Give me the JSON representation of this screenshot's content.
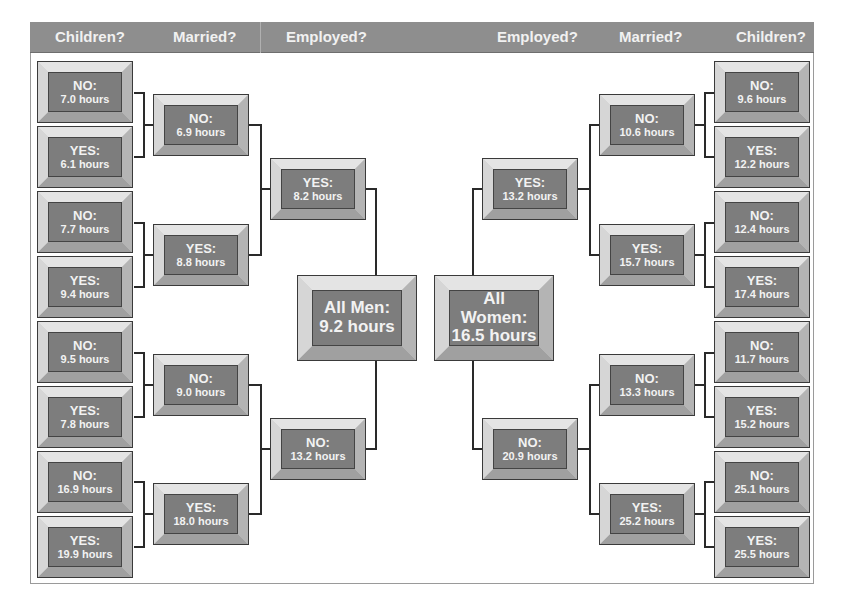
{
  "header": {
    "left": [
      "Children?",
      "Married?",
      "Employed?"
    ],
    "right": [
      "Employed?",
      "Married?",
      "Children?"
    ]
  },
  "men": {
    "root": {
      "label": "All Men:",
      "value": "9.2 hours"
    },
    "employed": [
      {
        "label": "YES:",
        "value": "8.2 hours"
      },
      {
        "label": "NO:",
        "value": "13.2 hours"
      }
    ],
    "married": [
      {
        "label": "NO:",
        "value": "6.9 hours"
      },
      {
        "label": "YES:",
        "value": "8.8  hours"
      },
      {
        "label": "NO:",
        "value": "9.0 hours"
      },
      {
        "label": "YES:",
        "value": "18.0 hours"
      }
    ],
    "children": [
      {
        "label": "NO:",
        "value": "7.0  hours"
      },
      {
        "label": "YES:",
        "value": "6.1  hours"
      },
      {
        "label": "NO:",
        "value": "7.7 hours"
      },
      {
        "label": "YES:",
        "value": "9.4 hours"
      },
      {
        "label": "NO:",
        "value": "9.5 hours"
      },
      {
        "label": "YES:",
        "value": "7.8 hours"
      },
      {
        "label": "NO:",
        "value": "16.9 hours"
      },
      {
        "label": "YES:",
        "value": "19.9 hours"
      }
    ]
  },
  "women": {
    "root": {
      "label": "All Women:",
      "value": "16.5 hours"
    },
    "employed": [
      {
        "label": "YES:",
        "value": "13.2 hours"
      },
      {
        "label": "NO:",
        "value": "20.9 hours"
      }
    ],
    "married": [
      {
        "label": "NO:",
        "value": "10.6 hours"
      },
      {
        "label": "YES:",
        "value": "15.7 hours"
      },
      {
        "label": "NO:",
        "value": "13.3 hours"
      },
      {
        "label": "YES:",
        "value": "25.2 hours"
      }
    ],
    "children": [
      {
        "label": "NO:",
        "value": "9.6 hours"
      },
      {
        "label": "YES:",
        "value": "12.2 hours"
      },
      {
        "label": "NO:",
        "value": "12.4 hours"
      },
      {
        "label": "YES:",
        "value": "17.4 hours"
      },
      {
        "label": "NO:",
        "value": "11.7 hours"
      },
      {
        "label": "YES:",
        "value": "15.2 hours"
      },
      {
        "label": "NO:",
        "value": "25.1 hours"
      },
      {
        "label": "YES:",
        "value": "25.5 hours"
      }
    ]
  },
  "colors": {
    "header_bg": "#8e8e8e",
    "face": "#7d7d7d",
    "text": "#f2f2f2",
    "connector": "#2a2a2a"
  }
}
